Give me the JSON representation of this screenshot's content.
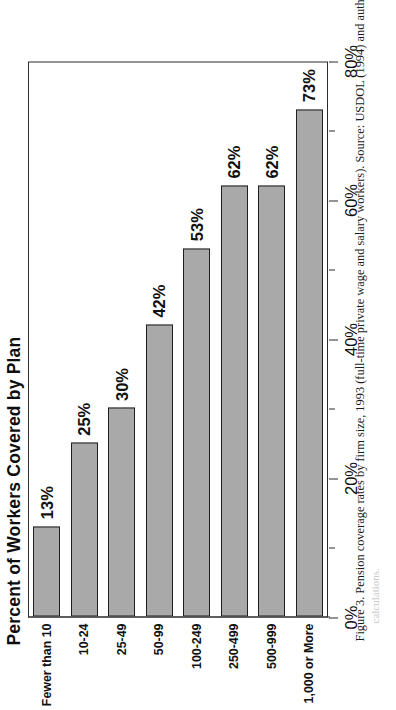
{
  "figure": {
    "caption": "Figure 3. Pension coverage rates by firm size, 1993 (full-time private wage and salary workers). Source: USDOL (1994) and authors'",
    "caption_continuation": "calculations."
  },
  "chart_data": {
    "type": "bar",
    "orientation": "vertical",
    "title": "Percent of Workers Covered by Plan",
    "xlabel": "",
    "ylabel": "",
    "categories": [
      "Fewer than 10",
      "10-24",
      "25-49",
      "50-99",
      "100-249",
      "250-499",
      "500-999",
      "1,000 or More"
    ],
    "values": [
      13,
      25,
      30,
      42,
      53,
      62,
      62,
      73
    ],
    "value_labels": [
      "13%",
      "25%",
      "30%",
      "42%",
      "53%",
      "62%",
      "62%",
      "73%"
    ],
    "ylim": [
      0,
      80
    ],
    "ytick_values": [
      0,
      20,
      40,
      60,
      80
    ],
    "ytick_labels": [
      "0%",
      "20%",
      "40%",
      "60%",
      "80%"
    ],
    "minor_tick_values": [
      10,
      30,
      50,
      70
    ],
    "grid": false,
    "legend": false,
    "bar_color": "#a9a9a9",
    "bar_border_color": "#1e1e1e",
    "axis_color": "#2b2b2b"
  }
}
